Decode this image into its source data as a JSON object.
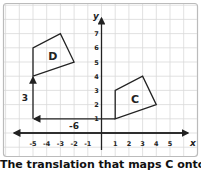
{
  "diagram": {
    "axes": {
      "x_label": "x",
      "y_label": "y",
      "x_ticks": [
        "-5",
        "-4",
        "-3",
        "-2",
        "-1",
        "1",
        "2",
        "3",
        "4",
        "5"
      ],
      "y_ticks": [
        "1",
        "2",
        "3",
        "4",
        "5",
        "6",
        "7"
      ]
    },
    "shapes": [
      {
        "label": "C",
        "vertices": [
          [
            1,
            1
          ],
          [
            1,
            3
          ],
          [
            3,
            4
          ],
          [
            4,
            2
          ]
        ]
      },
      {
        "label": "D",
        "vertices": [
          [
            -5,
            4
          ],
          [
            -5,
            6
          ],
          [
            -3,
            7
          ],
          [
            -2,
            5
          ]
        ]
      }
    ],
    "translation": {
      "horizontal_label": "-6",
      "vertical_label": "3",
      "path": [
        [
          1,
          1
        ],
        [
          -5,
          1
        ],
        [
          -5,
          4
        ]
      ]
    },
    "caption": "The translation that maps C onto D"
  },
  "chart_data": {
    "type": "scatter",
    "title": "",
    "xlabel": "x",
    "ylabel": "y",
    "xlim": [
      -5.5,
      5.8
    ],
    "ylim": [
      -1,
      7.6
    ],
    "grid": true,
    "series": [
      {
        "name": "C",
        "x": [
          1,
          1,
          3,
          4
        ],
        "y": [
          1,
          3,
          4,
          2
        ]
      },
      {
        "name": "D",
        "x": [
          -5,
          -5,
          -3,
          -2
        ],
        "y": [
          4,
          6,
          7,
          5
        ]
      }
    ],
    "annotations": [
      "-6",
      "3",
      "C",
      "D"
    ]
  },
  "colors": {
    "grid": "#d9d9d9",
    "ink": "#222222",
    "frame": "#bbbbbb"
  }
}
